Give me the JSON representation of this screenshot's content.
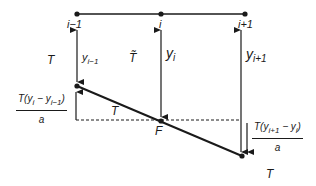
{
  "diagram": {
    "type": "string-tension-force-diagram",
    "nodes": [
      {
        "id": "i_minus_1",
        "label": "i−1",
        "x": 77
      },
      {
        "id": "i",
        "label": "i",
        "x": 161
      },
      {
        "id": "i_plus_1",
        "label": "i+1",
        "x": 245
      }
    ],
    "displacements": [
      {
        "label_base": "y",
        "label_sub": "i−1"
      },
      {
        "label_base": "y",
        "label_sub": "i"
      },
      {
        "label_base": "y",
        "label_sub": "i+1"
      }
    ],
    "tension_labels": {
      "left": "T",
      "middle": "T̃",
      "segment": "T",
      "bottom_right": "T"
    },
    "point_label": "F",
    "left_fraction": {
      "numerator": "T(y",
      "numerator_sub1": "i",
      "numerator_mid": " − y",
      "numerator_sub2": "i−1",
      "numerator_end": ")",
      "denominator": "a"
    },
    "right_fraction": {
      "numerator": "T(y",
      "numerator_sub1": "i+1",
      "numerator_mid": " − y",
      "numerator_sub2": "i",
      "numerator_end": ")",
      "denominator": "a"
    },
    "colors": {
      "line": "#1a1a1a",
      "background": "#ffffff"
    }
  }
}
